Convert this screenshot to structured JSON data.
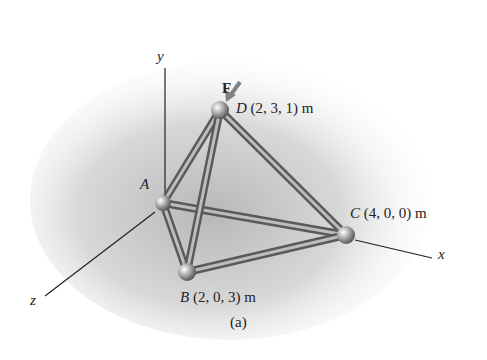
{
  "figure": {
    "caption": "(a)",
    "axes": {
      "x": "x",
      "y": "y",
      "z": "z"
    },
    "force": {
      "label": "F",
      "color": "#808080"
    },
    "nodes": {
      "A": {
        "name": "A",
        "coords": ""
      },
      "B": {
        "name": "B",
        "coords": "(2, 0, 3) m"
      },
      "C": {
        "name": "C",
        "coords": "(4, 0, 0) m"
      },
      "D": {
        "name": "D",
        "coords": "(2, 3, 1) m"
      }
    },
    "members": [
      "AB",
      "AC",
      "AD",
      "BC",
      "BD",
      "CD"
    ],
    "colors": {
      "member": "#8a8a8a",
      "shadow": "#c8c8c8",
      "axis": "#222222"
    }
  }
}
